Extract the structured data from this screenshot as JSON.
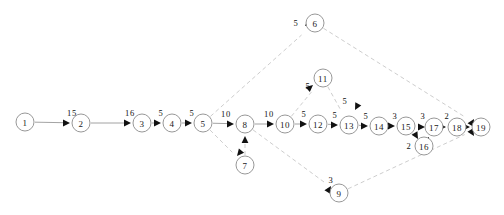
{
  "diagram": {
    "type": "directed-graph",
    "width": 504,
    "height": 215,
    "colors": {
      "background": "#ffffff",
      "node_stroke": "#8c8c8c",
      "node_fill": "#ffffff",
      "solid_edge": "#8c8c8c",
      "dashed_edge": "#c0c0c0",
      "arrow": "#111111",
      "text": "#111111"
    },
    "nodes": [
      {
        "id": "1",
        "label": "1",
        "x": 25,
        "y": 122,
        "r": 9
      },
      {
        "id": "2",
        "label": "2",
        "x": 81,
        "y": 123,
        "r": 9
      },
      {
        "id": "3",
        "label": "3",
        "x": 142,
        "y": 123,
        "r": 9
      },
      {
        "id": "4",
        "label": "4",
        "x": 172,
        "y": 123,
        "r": 9
      },
      {
        "id": "5",
        "label": "5",
        "x": 203,
        "y": 123,
        "r": 9
      },
      {
        "id": "6",
        "label": "6",
        "x": 315,
        "y": 23,
        "r": 9
      },
      {
        "id": "7",
        "label": "7",
        "x": 245,
        "y": 165,
        "r": 9
      },
      {
        "id": "8",
        "label": "8",
        "x": 245,
        "y": 124,
        "r": 9
      },
      {
        "id": "9",
        "label": "9",
        "x": 339,
        "y": 193,
        "r": 9
      },
      {
        "id": "10",
        "label": "10",
        "x": 285,
        "y": 124,
        "r": 9
      },
      {
        "id": "11",
        "label": "11",
        "x": 323,
        "y": 78,
        "r": 9
      },
      {
        "id": "12",
        "label": "12",
        "x": 318,
        "y": 124,
        "r": 9
      },
      {
        "id": "13",
        "label": "13",
        "x": 349,
        "y": 125,
        "r": 9
      },
      {
        "id": "14",
        "label": "14",
        "x": 379,
        "y": 126,
        "r": 9
      },
      {
        "id": "15",
        "label": "15",
        "x": 406,
        "y": 126,
        "r": 9
      },
      {
        "id": "16",
        "label": "16",
        "x": 424,
        "y": 146,
        "r": 9
      },
      {
        "id": "17",
        "label": "17",
        "x": 434,
        "y": 127,
        "r": 9
      },
      {
        "id": "18",
        "label": "18",
        "x": 457,
        "y": 127,
        "r": 9
      },
      {
        "id": "19",
        "label": "19",
        "x": 481,
        "y": 127,
        "r": 9
      }
    ],
    "edges": [
      {
        "from": "1",
        "to": "2",
        "weight": "15",
        "style": "solid",
        "lx": 72,
        "ly": 113
      },
      {
        "from": "2",
        "to": "3",
        "weight": "16",
        "style": "solid",
        "lx": 130,
        "ly": 113
      },
      {
        "from": "3",
        "to": "4",
        "weight": "5",
        "style": "solid",
        "lx": 161,
        "ly": 113
      },
      {
        "from": "4",
        "to": "5",
        "weight": "5",
        "style": "solid",
        "lx": 192,
        "ly": 113
      },
      {
        "from": "5",
        "to": "8",
        "weight": "10",
        "style": "solid",
        "lx": 226,
        "ly": 114
      },
      {
        "from": "8",
        "to": "10",
        "weight": "10",
        "style": "solid",
        "lx": 269,
        "ly": 114
      },
      {
        "from": "10",
        "to": "12",
        "weight": "5",
        "style": "solid",
        "lx": 304,
        "ly": 114
      },
      {
        "from": "12",
        "to": "13",
        "weight": "5",
        "style": "solid",
        "lx": 335,
        "ly": 115
      },
      {
        "from": "13",
        "to": "14",
        "weight": "5",
        "style": "solid",
        "lx": 366,
        "ly": 116
      },
      {
        "from": "14",
        "to": "15",
        "weight": "3",
        "style": "solid",
        "lx": 395,
        "ly": 116
      },
      {
        "from": "15",
        "to": "16",
        "weight": "2",
        "style": "solid",
        "lx": 409,
        "ly": 146
      },
      {
        "from": "16",
        "to": "17",
        "weight": "",
        "style": "solid",
        "lx": 430,
        "ly": 140
      },
      {
        "from": "15",
        "to": "17",
        "weight": "3",
        "style": "solid",
        "lx": 423,
        "ly": 116
      },
      {
        "from": "17",
        "to": "18",
        "weight": "2",
        "style": "solid",
        "lx": 447,
        "ly": 116
      },
      {
        "from": "18",
        "to": "19",
        "weight": "",
        "style": "solid",
        "lx": 470,
        "ly": 118
      },
      {
        "from": "5",
        "to": "6",
        "weight": "5",
        "style": "dashed",
        "lx": 296,
        "ly": 23
      },
      {
        "from": "5",
        "to": "7",
        "weight": "",
        "style": "dashed",
        "lx": 222,
        "ly": 152
      },
      {
        "from": "7",
        "to": "8",
        "weight": "",
        "style": "dashed",
        "lx": 252,
        "ly": 145
      },
      {
        "from": "8",
        "to": "9",
        "weight": "3",
        "style": "dashed",
        "lx": 331,
        "ly": 180
      },
      {
        "from": "10",
        "to": "11",
        "weight": "5",
        "style": "dashed",
        "lx": 308,
        "ly": 86
      },
      {
        "from": "11",
        "to": "13",
        "weight": "5",
        "style": "dashed",
        "lx": 345,
        "ly": 101
      },
      {
        "from": "6",
        "to": "19",
        "weight": "",
        "style": "dashed",
        "lx": 430,
        "ly": 70
      },
      {
        "from": "9",
        "to": "19",
        "weight": "",
        "style": "dashed",
        "lx": 430,
        "ly": 175
      }
    ],
    "arrowheads": [
      {
        "name": "arrow-to-2",
        "x": 70,
        "y": 123,
        "angle": 0
      },
      {
        "name": "arrow-to-3",
        "x": 131,
        "y": 123,
        "angle": 0
      },
      {
        "name": "arrow-to-4",
        "x": 161,
        "y": 123,
        "angle": 0
      },
      {
        "name": "arrow-to-5",
        "x": 192,
        "y": 123,
        "angle": 0
      },
      {
        "name": "arrow-to-8",
        "x": 234,
        "y": 124,
        "angle": 0
      },
      {
        "name": "arrow-to-10",
        "x": 274,
        "y": 124,
        "angle": 0
      },
      {
        "name": "arrow-to-12",
        "x": 307,
        "y": 124,
        "angle": 0
      },
      {
        "name": "arrow-to-13",
        "x": 338,
        "y": 125,
        "angle": 0
      },
      {
        "name": "arrow-to-14",
        "x": 368,
        "y": 126,
        "angle": 0
      },
      {
        "name": "arrow-to-15",
        "x": 395,
        "y": 126,
        "angle": 0
      },
      {
        "name": "arrow-to-17-from-15",
        "x": 425,
        "y": 127,
        "angle": 0
      },
      {
        "name": "arrow-to-18",
        "x": 446,
        "y": 127,
        "angle": 0
      },
      {
        "name": "arrow-to-19-from-18",
        "x": 470,
        "y": 127,
        "angle": 0
      },
      {
        "name": "arrow-to-6",
        "x": 305,
        "y": 26,
        "angle": 140
      },
      {
        "name": "arrow-to-7",
        "x": 237,
        "y": 156,
        "angle": 130
      },
      {
        "name": "arrow-to-8-from-7",
        "x": 245,
        "y": 136,
        "angle": -90
      },
      {
        "name": "arrow-to-9",
        "x": 331,
        "y": 186,
        "angle": -58
      },
      {
        "name": "arrow-to-11",
        "x": 313,
        "y": 85,
        "angle": -40
      },
      {
        "name": "arrow-to-13-from-11",
        "x": 355,
        "y": 110,
        "angle": 118
      },
      {
        "name": "arrow-to-16",
        "x": 418,
        "y": 139,
        "angle": 60
      },
      {
        "name": "arrow-to-17-from-16",
        "x": 429,
        "y": 137,
        "angle": -62
      },
      {
        "name": "arrow-to-19-from-6",
        "x": 474,
        "y": 119,
        "angle": -60
      },
      {
        "name": "arrow-to-19-from-9",
        "x": 474,
        "y": 136,
        "angle": 58
      }
    ]
  }
}
